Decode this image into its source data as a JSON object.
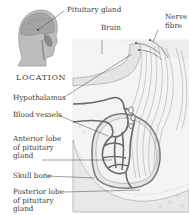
{
  "diagram": {
    "title_inset": "LOCATION",
    "labels": {
      "pituitary_gland": "Pituitary gland",
      "brain": "Brain",
      "nerve_fibre": [
        "Nerve",
        "fibre"
      ],
      "hypothalamus": "Hypothalamus",
      "blood_vessels": "Blood vessels",
      "anterior_lobe": [
        "Anterior lobe",
        "of pituitary",
        "gland"
      ],
      "skull_bone": "Skull bone",
      "posterior_lobe": [
        "Posterior lobe",
        "of pituitary",
        "gland"
      ]
    },
    "colors": {
      "head_fill": "#b9b9b9",
      "line": "#555555",
      "vessel": "#6a6a6a",
      "panel_bg": "#f4f4f4"
    }
  }
}
